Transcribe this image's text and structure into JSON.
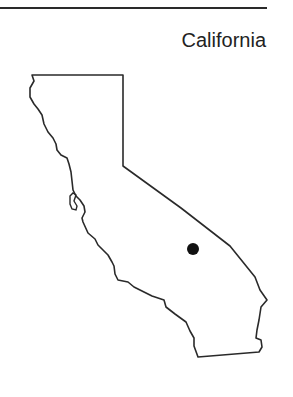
{
  "header": {
    "title": "California"
  },
  "map": {
    "region": "California",
    "marker": {
      "shape": "dot",
      "color": "#111111"
    },
    "outline_color": "#2a2a2a"
  }
}
